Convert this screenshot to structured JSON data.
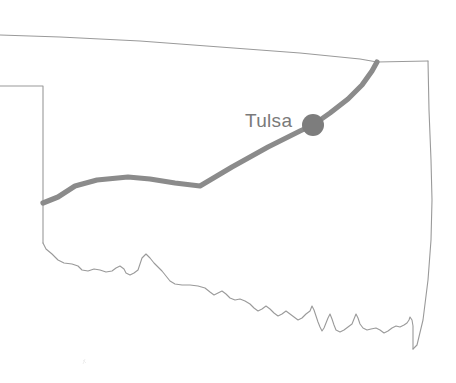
{
  "map": {
    "title": "Oklahoma state route map",
    "region_name": "Oklahoma",
    "background_color": "#ffffff",
    "border_color": "#9a9a9a",
    "route_color": "#8b8b8b",
    "city_marker_color": "#7d7d7d",
    "label_color": "#7a7a7a",
    "canvas": {
      "width": 456,
      "height": 383
    },
    "cities": [
      {
        "name": "Tulsa",
        "label": "Tulsa",
        "marker_x": 313,
        "marker_y": 125,
        "marker_radius": 11,
        "label_x": 245,
        "label_y": 127
      }
    ],
    "route": {
      "name": "highlighted-route",
      "stroke_width": 5.2,
      "path": "M 43 203 L 58 197 L 75 186 L 97 180 L 128 177 L 150 179 L 175 183 L 200 186 L 232 167 L 268 147 L 300 131 L 313 125 L 330 113 L 348 99 L 362 85 L 372 71 L 377 62"
    },
    "outline": {
      "name": "state-border",
      "stroke_width": 1.1,
      "panhandle_top": "M 0 35 L 60 37 L 140 41 L 220 47 L 300 53 L 360 59 L 377 62 L 428 61",
      "panhandle_south": "M 0 86 L 20 86 L 43 86 L 43 130 L 43 170 L 43 203 L 43 243",
      "east_border": "M 428 61 L 429 110 L 431 160 L 432 200 L 431 240 L 428 280 L 423 320 L 417 345 L 413 349",
      "south_border": "M 43 243 L 46 249 L 52 254 L 58 260 L 64 263 L 72 264 L 78 266 L 82 270 L 88 271 L 94 269 L 100 270 L 106 272 L 112 271 L 116 268 L 120 266 L 124 269 L 126 273 L 130 275 L 134 273 L 138 270 L 140 264 L 142 258 L 146 254 L 150 258 L 154 263 L 158 267 L 162 271 L 166 276 L 170 281 L 175 284 L 182 285 L 190 285 L 198 286 L 205 288 L 210 292 L 214 295 L 218 293 L 222 291 L 226 294 L 230 298 L 235 300 L 240 299 L 245 301 L 250 304 L 254 308 L 258 311 L 262 309 L 266 306 L 270 309 L 274 313 L 278 316 L 282 314 L 286 311 L 290 314 L 294 317 L 298 320 L 302 318 L 306 314 L 310 311 L 312 306 L 314 310 L 316 316 L 318 322 L 320 327 L 322 331 L 324 328 L 326 323 L 328 318 L 330 314 L 332 319 L 334 325 L 336 330 L 340 332 L 344 330 L 348 327 L 352 324 L 354 319 L 356 314 L 358 318 L 360 324 L 363 328 L 367 330 L 371 329 L 376 328 L 380 330 L 384 333 L 388 331 L 392 328 L 396 326 L 400 327 L 404 325 L 407 323 L 409 320 L 410 317 L 412 320 L 413 326 L 413 334 L 413 342 L 413 349"
    },
    "elements": [
      {
        "name": "state-outline",
        "description": "Oklahoma state boundary with panhandle and Red River southern border"
      },
      {
        "name": "route-line",
        "description": "Thick gray route running west to northeast through Tulsa"
      },
      {
        "name": "city-marker-tulsa",
        "description": "Filled circle marking Tulsa"
      },
      {
        "name": "city-label-tulsa",
        "description": "Text label reading Tulsa"
      }
    ]
  }
}
